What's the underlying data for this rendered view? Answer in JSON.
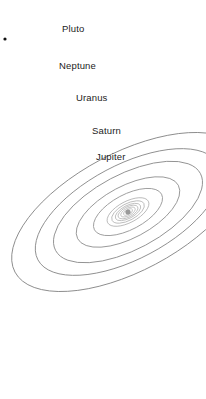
{
  "figure": {
    "kind": "solar-system-orbit-diagram",
    "background_color": "#ffffff",
    "orbit_stroke_color": "#8a8a8a",
    "inner_orbit_stroke_color": "#b0b0b0",
    "label_color": "#1c1c1c",
    "sun_color": "#9a9a9a",
    "corner_dot_color": "#111111",
    "width": 206,
    "height": 399
  },
  "chart_data": {
    "type": "scatter",
    "title": "",
    "xlabel": "",
    "ylabel": "",
    "projection": "tilted-concentric-ellipses",
    "center": {
      "x": 128,
      "y": 212
    },
    "rotation_deg": -28,
    "axis_ratio": 0.46,
    "labeled_orbits": [
      "Jupiter",
      "Saturn",
      "Uranus",
      "Neptune",
      "Pluto"
    ],
    "unlabeled_inner_orbits": 6,
    "orbits": [
      {
        "name": "",
        "labeled": false,
        "rx": 5,
        "ry": 2.3,
        "stroke": "#b4b4b4"
      },
      {
        "name": "",
        "labeled": false,
        "rx": 8,
        "ry": 3.7,
        "stroke": "#b4b4b4"
      },
      {
        "name": "",
        "labeled": false,
        "rx": 11,
        "ry": 5.1,
        "stroke": "#b0b0b0"
      },
      {
        "name": "",
        "labeled": false,
        "rx": 14,
        "ry": 6.4,
        "stroke": "#aeaeae"
      },
      {
        "name": "",
        "labeled": false,
        "rx": 18,
        "ry": 8.3,
        "stroke": "#ababab"
      },
      {
        "name": "",
        "labeled": false,
        "rx": 23,
        "ry": 10.6,
        "stroke": "#a8a8a8"
      },
      {
        "name": "Jupiter",
        "labeled": true,
        "rx": 38,
        "ry": 17.5,
        "stroke": "#9a9a9a"
      },
      {
        "name": "Saturn",
        "labeled": true,
        "rx": 57,
        "ry": 26,
        "stroke": "#939393"
      },
      {
        "name": "Uranus",
        "labeled": true,
        "rx": 82,
        "ry": 37.5,
        "stroke": "#8d8d8d"
      },
      {
        "name": "Neptune",
        "labeled": true,
        "rx": 102,
        "ry": 47,
        "stroke": "#8a8a8a"
      },
      {
        "name": "Pluto",
        "labeled": true,
        "rx": 128,
        "ry": 59,
        "stroke": "#878787"
      }
    ]
  },
  "labels": {
    "pluto": {
      "text": "Pluto",
      "x": 62,
      "y": 24
    },
    "neptune": {
      "text": "Neptune",
      "x": 59,
      "y": 61
    },
    "uranus": {
      "text": "Uranus",
      "x": 76,
      "y": 93
    },
    "saturn": {
      "text": "Saturn",
      "x": 92,
      "y": 126
    },
    "jupiter": {
      "text": "Jupiter",
      "x": 96,
      "y": 152
    }
  },
  "marks": {
    "sun": {
      "x": 128,
      "y": 212,
      "r": 2.6
    },
    "corner_dot": {
      "x": 5,
      "y": 39,
      "r": 1.6
    }
  }
}
